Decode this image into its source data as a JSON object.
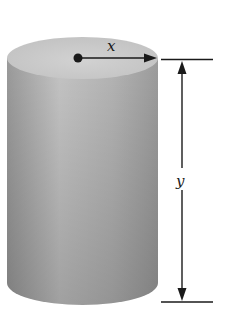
{
  "diagram": {
    "type": "cylinder-with-dimensions",
    "labels": {
      "radius": "x",
      "height": "y"
    },
    "colors": {
      "body_light": "#c8c8c8",
      "body_dark": "#8a8a8a",
      "top_face": "#cfcfcf",
      "ink": "#1a1a1a"
    }
  }
}
